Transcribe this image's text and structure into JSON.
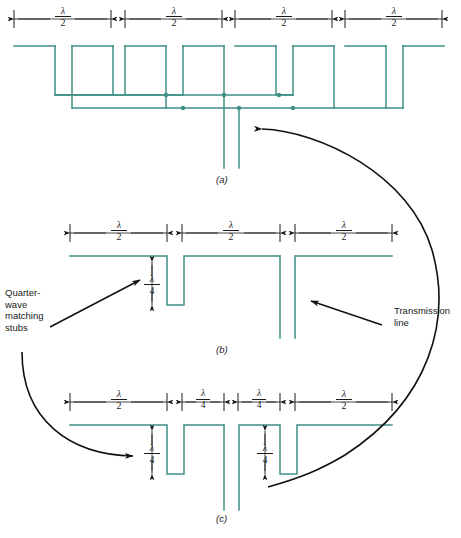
{
  "figure": {
    "title_hidden": "",
    "line_color": "#3f8f85",
    "annotation_color": "#1a1a1a",
    "background": "#ffffff"
  },
  "panels": [
    {
      "id": "a",
      "label": "(a)"
    },
    {
      "id": "b",
      "label": "(b)"
    },
    {
      "id": "c",
      "label": "(c)"
    }
  ],
  "callouts": {
    "quarter_wave": {
      "lines": [
        "Quarter-",
        "wave",
        "matching",
        "stubs"
      ],
      "text": "Quarter-wave matching stubs"
    },
    "transmission_line": {
      "lines": [
        "Transmission",
        "line"
      ],
      "text": "Transmission line"
    }
  },
  "dimensions": {
    "half_wave": {
      "numerator": "λ",
      "denominator": "2",
      "text": "λ/2"
    },
    "quarter_wave": {
      "numerator": "λ",
      "denominator": "4",
      "text": "λ/4"
    }
  },
  "panel_a": {
    "top_dimensions": [
      {
        "label_num": "λ",
        "label_den": "2",
        "x1": 14,
        "x2": 111
      },
      {
        "label_num": "λ",
        "label_den": "2",
        "x1": 125,
        "x2": 222
      },
      {
        "label_num": "λ",
        "label_den": "2",
        "x1": 235,
        "x2": 332
      },
      {
        "label_num": "λ",
        "label_den": "2",
        "x1": 345,
        "x2": 442
      }
    ],
    "junction_dots": 6,
    "feed_lines": 2
  },
  "panel_b": {
    "top_dimensions": [
      {
        "label_num": "λ",
        "label_den": "2",
        "x1": 70,
        "x2": 167
      },
      {
        "label_num": "λ",
        "label_den": "2",
        "x1": 182,
        "x2": 280
      },
      {
        "label_num": "λ",
        "label_den": "2",
        "x1": 295,
        "x2": 392
      }
    ],
    "stub_dimension": {
      "label_num": "λ",
      "label_den": "4"
    },
    "stub_count": 1,
    "feed_lines": 2
  },
  "panel_c": {
    "top_dimensions": [
      {
        "label_num": "λ",
        "label_den": "2",
        "x1": 70,
        "x2": 167
      },
      {
        "label_num": "λ",
        "label_den": "4",
        "x1": 182,
        "x2": 224
      },
      {
        "label_num": "λ",
        "label_den": "4",
        "x1": 238,
        "x2": 280
      },
      {
        "label_num": "λ",
        "label_den": "2",
        "x1": 295,
        "x2": 392
      }
    ],
    "stub_dimensions": [
      {
        "label_num": "λ",
        "label_den": "4"
      },
      {
        "label_num": "λ",
        "label_den": "4"
      }
    ],
    "stub_count": 2,
    "feed_lines": 2
  }
}
